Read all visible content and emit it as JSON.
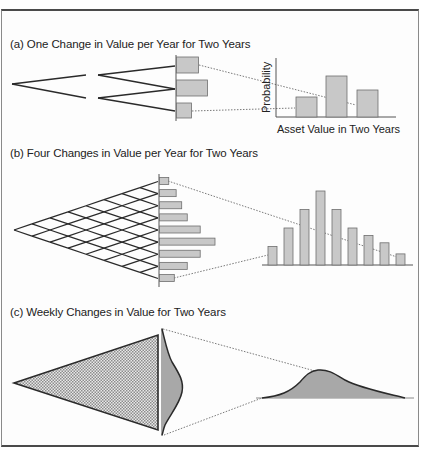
{
  "figure": {
    "panels": [
      {
        "id": "a",
        "title": "(a) One Change in Value per Year for Two Years",
        "y_axis_label": "Probability",
        "x_axis_label": "Asset Value in Two Years"
      },
      {
        "id": "b",
        "title": "(b) Four Changes in Value per Year for Two Years"
      },
      {
        "id": "c",
        "title": "(c) Weekly Changes in Value for Two Years"
      }
    ],
    "colors": {
      "bar_fill": "#c8c8c8",
      "bar_stroke": "#6e6e6e",
      "tree_line": "#2a2a2a",
      "dotted_line": "#7a7a7a",
      "curve_fill": "#a8a8a8",
      "frame_border": "#4a4a4a"
    }
  },
  "chart_data": [
    {
      "type": "bar",
      "title": "(a) One Change in Value per Year for Two Years",
      "xlabel": "Asset Value in Two Years",
      "ylabel": "Probability",
      "categories": [
        "low",
        "middle",
        "high"
      ],
      "values": [
        1,
        2,
        1.35
      ],
      "note": "Binomial tree with 2 steps; side histogram bars of relative length 1, 2, 1 (top, middle, bottom)"
    },
    {
      "type": "bar",
      "title": "(b) Four Changes in Value per Year for Two Years",
      "categories": [
        "1",
        "2",
        "3",
        "4",
        "5",
        "6",
        "7",
        "8",
        "9"
      ],
      "values": [
        1.0,
        2.0,
        3.0,
        4.0,
        3.0,
        2.0,
        1.6,
        1.2,
        0.6
      ],
      "side_histogram_lengths": [
        0.25,
        0.45,
        0.6,
        0.75,
        1.1,
        1.5,
        1.1,
        0.75,
        0.4
      ],
      "note": "Binomial lattice with 8 steps; histogram shows distribution of final values"
    },
    {
      "type": "area",
      "title": "(c) Weekly Changes in Value for Two Years",
      "note": "Dense lattice (104 weekly steps) approaching a continuous, right-skewed (lognormal-like) distribution"
    }
  ]
}
